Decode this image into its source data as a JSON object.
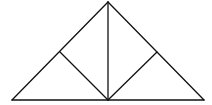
{
  "diagram": {
    "type": "geometric-figure",
    "colors": {
      "stroke": "#111111",
      "background": "#ffffff"
    },
    "points": {
      "A": [
        108,
        2
      ],
      "B": [
        12,
        100
      ],
      "C": [
        204,
        100
      ],
      "D": [
        108,
        100
      ],
      "E": [
        60,
        52
      ],
      "F": [
        157,
        52
      ]
    },
    "segments": [
      {
        "id": "AB",
        "from": "A",
        "to": "B",
        "x1": 108,
        "y1": 2,
        "x2": 12,
        "y2": 100
      },
      {
        "id": "AC",
        "from": "A",
        "to": "C",
        "x1": 108,
        "y1": 2,
        "x2": 204,
        "y2": 100
      },
      {
        "id": "BC",
        "from": "B",
        "to": "C",
        "x1": 12,
        "y1": 100,
        "x2": 204,
        "y2": 100
      },
      {
        "id": "AD",
        "from": "A",
        "to": "D",
        "x1": 108,
        "y1": 2,
        "x2": 108,
        "y2": 100
      },
      {
        "id": "DE",
        "from": "D",
        "to": "E",
        "x1": 108,
        "y1": 100,
        "x2": 60,
        "y2": 52
      },
      {
        "id": "DF",
        "from": "D",
        "to": "F",
        "x1": 108,
        "y1": 100,
        "x2": 157,
        "y2": 52
      }
    ]
  }
}
